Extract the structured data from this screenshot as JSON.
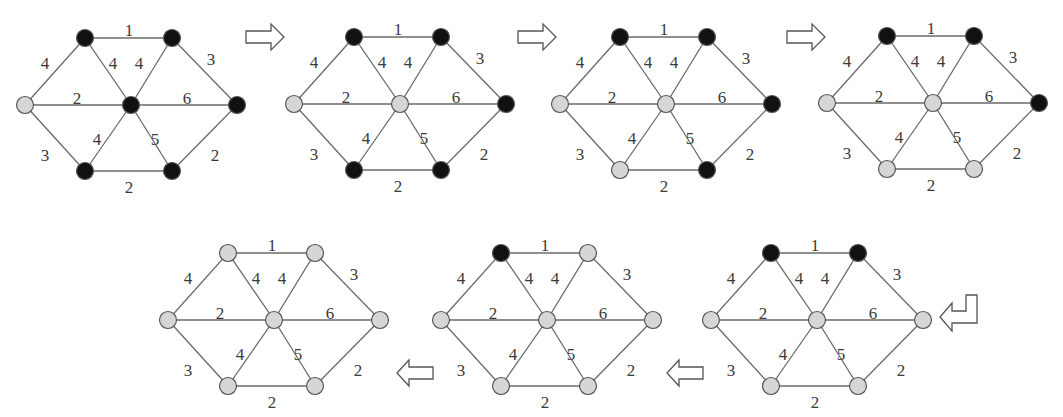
{
  "colors": {
    "visited_node": "#d6d6d6",
    "unvisited_node": "#111111",
    "node_stroke": "#555555",
    "edge": "#6a6a6a",
    "label": "#3a3a3a",
    "arrow_stroke": "#555555"
  },
  "graph_template": {
    "nodes": [
      {
        "id": "L",
        "dx": 0,
        "dy": 0
      },
      {
        "id": "TL",
        "dx": 60,
        "dy": -67
      },
      {
        "id": "TR",
        "dx": 147,
        "dy": -67
      },
      {
        "id": "C",
        "dx": 106,
        "dy": 0
      },
      {
        "id": "R",
        "dx": 212,
        "dy": 0
      },
      {
        "id": "BL",
        "dx": 60,
        "dy": 66
      },
      {
        "id": "BR",
        "dx": 147,
        "dy": 66
      }
    ],
    "edges": [
      {
        "a": "TL",
        "b": "TR",
        "w": "1",
        "lx": 104,
        "ly": -73
      },
      {
        "a": "L",
        "b": "TL",
        "w": "4",
        "lx": 20,
        "ly": -40
      },
      {
        "a": "TL",
        "b": "C",
        "w": "4",
        "lx": 88,
        "ly": -40
      },
      {
        "a": "TR",
        "b": "C",
        "w": "4",
        "lx": 114,
        "ly": -40
      },
      {
        "a": "TR",
        "b": "R",
        "w": "3",
        "lx": 186,
        "ly": -44
      },
      {
        "a": "L",
        "b": "C",
        "w": "2",
        "lx": 52,
        "ly": -5
      },
      {
        "a": "C",
        "b": "R",
        "w": "6",
        "lx": 162,
        "ly": -5
      },
      {
        "a": "L",
        "b": "BL",
        "w": "3",
        "lx": 20,
        "ly": 52
      },
      {
        "a": "C",
        "b": "BL",
        "w": "4",
        "lx": 72,
        "ly": 36
      },
      {
        "a": "C",
        "b": "BR",
        "w": "5",
        "lx": 130,
        "ly": 36
      },
      {
        "a": "R",
        "b": "BR",
        "w": "2",
        "lx": 190,
        "ly": 52
      },
      {
        "a": "BL",
        "b": "BR",
        "w": "2",
        "lx": 104,
        "ly": 84
      }
    ]
  },
  "steps": [
    {
      "step": 1,
      "x": 25,
      "y": 105,
      "visited": [
        "L"
      ]
    },
    {
      "step": 2,
      "x": 294,
      "y": 104,
      "visited": [
        "L",
        "C"
      ]
    },
    {
      "step": 3,
      "x": 560,
      "y": 104,
      "visited": [
        "L",
        "C",
        "BL"
      ]
    },
    {
      "step": 4,
      "x": 827,
      "y": 103,
      "visited": [
        "L",
        "C",
        "BL",
        "BR"
      ]
    },
    {
      "step": 5,
      "x": 711,
      "y": 320,
      "visited": [
        "L",
        "C",
        "BL",
        "BR",
        "R"
      ]
    },
    {
      "step": 6,
      "x": 441,
      "y": 320,
      "visited": [
        "L",
        "C",
        "BL",
        "BR",
        "R",
        "TR"
      ]
    },
    {
      "step": 7,
      "x": 168,
      "y": 320,
      "visited": [
        "L",
        "C",
        "BL",
        "BR",
        "R",
        "TR",
        "TL"
      ]
    }
  ],
  "arrows": [
    {
      "name": "arrow-right-1",
      "type": "right",
      "x": 246,
      "y": 36
    },
    {
      "name": "arrow-right-2",
      "type": "right",
      "x": 518,
      "y": 36
    },
    {
      "name": "arrow-right-3",
      "type": "right",
      "x": 787,
      "y": 36
    },
    {
      "name": "arrow-down-left",
      "type": "hook-left",
      "x": 940,
      "y": 303
    },
    {
      "name": "arrow-left-1",
      "type": "left",
      "x": 667,
      "y": 372
    },
    {
      "name": "arrow-left-2",
      "type": "left",
      "x": 397,
      "y": 372
    }
  ]
}
